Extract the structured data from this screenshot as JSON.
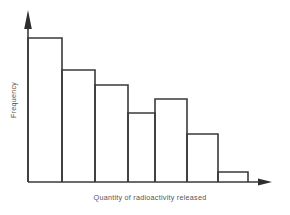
{
  "chart_data": {
    "type": "bar",
    "title": "",
    "xlabel": "Quantity of radioactivity released",
    "ylabel": "Frequency",
    "categories": [
      "1",
      "2",
      "3",
      "4",
      "5",
      "6",
      "7"
    ],
    "values": [
      144,
      112,
      97,
      69,
      83,
      48,
      10
    ],
    "ylim": [
      0,
      158
    ],
    "grid": false,
    "legend": null,
    "axis_ticks": false,
    "axis_arrows": {
      "x": "right-arrow",
      "y": "up-arrow"
    },
    "bar_style": {
      "fill": "none",
      "edge_color": "#3a3a3a",
      "contiguous": true
    },
    "annotation": "Right-skewed histogram with a local rise at the fifth interval"
  },
  "figure": {
    "background": "#ffffff",
    "line_color": "#3a3a3a",
    "label_color": "#55555a"
  }
}
